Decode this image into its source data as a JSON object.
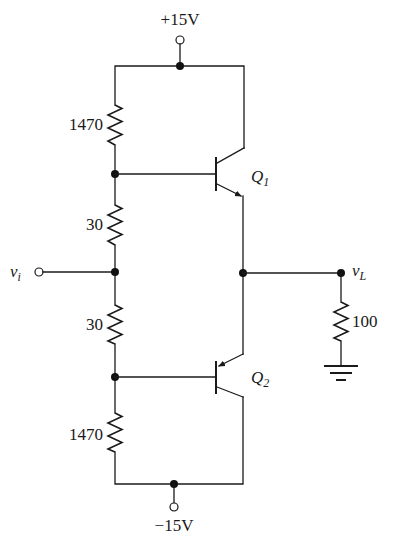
{
  "diagram": {
    "type": "circuit-schematic",
    "supplies": {
      "positive": {
        "label": "+15V"
      },
      "negative": {
        "label": "−15V"
      }
    },
    "input": {
      "label": "v",
      "subscript": "i"
    },
    "output": {
      "label": "v",
      "subscript": "L"
    },
    "resistors": [
      {
        "id": "R1",
        "value": "1470",
        "position": "top-left bias"
      },
      {
        "id": "R2",
        "value": "30",
        "position": "upper diode-bias"
      },
      {
        "id": "R3",
        "value": "30",
        "position": "lower diode-bias"
      },
      {
        "id": "R4",
        "value": "1470",
        "position": "bottom-left bias"
      },
      {
        "id": "RL",
        "value": "100",
        "position": "load"
      }
    ],
    "transistors": [
      {
        "id": "Q1",
        "label": "Q",
        "subscript": "1",
        "type": "NPN"
      },
      {
        "id": "Q2",
        "label": "Q",
        "subscript": "2",
        "type": "PNP"
      }
    ],
    "ground": {
      "symbol": "ground"
    }
  }
}
